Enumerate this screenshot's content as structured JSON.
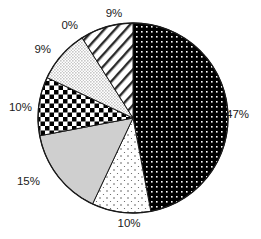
{
  "chart_data": {
    "type": "pie",
    "title": "",
    "subtitle": "",
    "xlabel": "",
    "ylabel": "",
    "legend_position": "none",
    "grid": false,
    "start_angle_deg": 0,
    "direction": "clockwise",
    "categories": [
      "Slice 1",
      "Slice 2",
      "Slice 3",
      "Slice 4",
      "Slice 5",
      "Slice 6",
      "Slice 7"
    ],
    "values": [
      47,
      10,
      15,
      10,
      9,
      0,
      9
    ],
    "labels": [
      "47%",
      "10%",
      "15%",
      "10%",
      "9%",
      "0%",
      "9%"
    ],
    "slices": [
      {
        "label": "47%",
        "value": 47,
        "fill": "black-dotted-grid",
        "base_color": "#000000",
        "accent_color": "#ffffff",
        "label_x": 226,
        "label_y": 115,
        "label_anchor": "start"
      },
      {
        "label": "10%",
        "value": 10,
        "fill": "sparse-dots",
        "base_color": "#ffffff",
        "accent_color": "#555555",
        "label_x": 129,
        "label_y": 224,
        "label_anchor": "middle"
      },
      {
        "label": "15%",
        "value": 15,
        "fill": "solid-gray",
        "base_color": "#cfcfcf",
        "accent_color": "#cfcfcf",
        "label_x": 40,
        "label_y": 182,
        "label_anchor": "end"
      },
      {
        "label": "10%",
        "value": 10,
        "fill": "checkerboard",
        "base_color": "#ffffff",
        "accent_color": "#000000",
        "label_x": 32,
        "label_y": 108,
        "label_anchor": "end"
      },
      {
        "label": "9%",
        "value": 9,
        "fill": "fine-stipple",
        "base_color": "#ffffff",
        "accent_color": "#666666",
        "label_x": 51,
        "label_y": 50,
        "label_anchor": "end"
      },
      {
        "label": "0%",
        "value": 0,
        "fill": "blank",
        "base_color": "#ffffff",
        "accent_color": "#ffffff",
        "label_x": 78,
        "label_y": 26,
        "label_anchor": "end"
      },
      {
        "label": "9%",
        "value": 9,
        "fill": "diagonal-stripes",
        "base_color": "#ffffff",
        "accent_color": "#333333",
        "label_x": 114,
        "label_y": 14,
        "label_anchor": "middle"
      }
    ],
    "geometry": {
      "center_x": 133,
      "center_y": 118,
      "radius": 95,
      "outline_color": "#1a1a1a"
    },
    "total": 100
  },
  "figure": {
    "background": "#ffffff",
    "width": 261,
    "height": 239
  }
}
